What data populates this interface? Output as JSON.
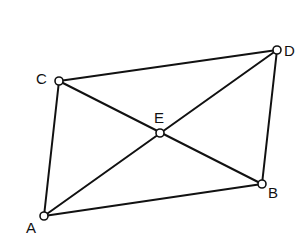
{
  "diagram": {
    "type": "geometry-quadrilateral",
    "points": [
      {
        "id": "A",
        "label": "A",
        "x": 44,
        "y": 216,
        "lx": 26,
        "ly": 233
      },
      {
        "id": "B",
        "label": "B",
        "x": 262,
        "y": 184,
        "lx": 268,
        "ly": 198
      },
      {
        "id": "C",
        "label": "C",
        "x": 59,
        "y": 81,
        "lx": 36,
        "ly": 84
      },
      {
        "id": "D",
        "label": "D",
        "x": 277,
        "y": 50,
        "lx": 284,
        "ly": 56
      },
      {
        "id": "E",
        "label": "E",
        "x": 160,
        "y": 133,
        "lx": 154,
        "ly": 123
      }
    ],
    "segments": [
      [
        "C",
        "D"
      ],
      [
        "D",
        "B"
      ],
      [
        "B",
        "A"
      ],
      [
        "A",
        "C"
      ],
      [
        "A",
        "D"
      ],
      [
        "C",
        "B"
      ]
    ],
    "stroke_color": "#111111",
    "background": "#ffffff"
  }
}
